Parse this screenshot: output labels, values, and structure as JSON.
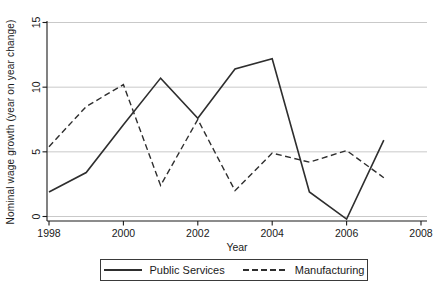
{
  "chart_data": {
    "type": "line",
    "title": "",
    "xlabel": "Year",
    "ylabel": "Nominal wage growth (year on year change)",
    "x": [
      1998,
      1999,
      2000,
      2001,
      2002,
      2003,
      2004,
      2005,
      2006,
      2007
    ],
    "series": [
      {
        "name": "Public Services",
        "line_style": "solid",
        "values": [
          1.9,
          3.4,
          7.1,
          10.7,
          7.6,
          11.4,
          12.2,
          1.9,
          -0.2,
          5.9
        ]
      },
      {
        "name": "Manufacturing",
        "line_style": "dashed",
        "values": [
          5.4,
          8.5,
          10.2,
          2.4,
          7.5,
          2.0,
          4.9,
          4.2,
          5.1,
          3.0
        ]
      }
    ],
    "xlim": [
      1998,
      2008
    ],
    "ylim": [
      0,
      15
    ],
    "x_ticks": [
      1998,
      2000,
      2002,
      2004,
      2006,
      2008
    ],
    "y_ticks": [
      0,
      5,
      10,
      15
    ],
    "grid": true,
    "legend_position": "bottom-outside-boxed"
  },
  "colors": {
    "line": "#2e2e2e",
    "grid": "#c9c9c9",
    "axis": "#1a1a1a",
    "text": "#1a1a1a",
    "background": "#ffffff",
    "legend_border": "#3a3a3a"
  }
}
